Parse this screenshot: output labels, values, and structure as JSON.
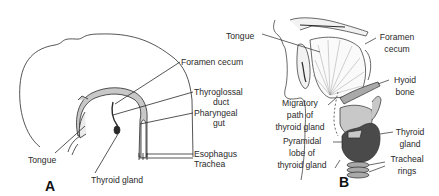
{
  "figure": {
    "panels": [
      {
        "id": "A",
        "letter": "A",
        "labels": {
          "foramen_cecum": "Foramen cecum",
          "thyroglossal_duct_1": "Thyroglossal",
          "thyroglossal_duct_2": "duct",
          "pharyngeal_gut_1": "Pharyngeal",
          "pharyngeal_gut_2": "gut",
          "esophagus": "Esophagus",
          "trachea": "Trachea",
          "tongue": "Tongue",
          "thyroid_gland": "Thyroid gland"
        }
      },
      {
        "id": "B",
        "letter": "B",
        "labels": {
          "tongue": "Tongue",
          "foramen_cecum_1": "Foramen",
          "foramen_cecum_2": "cecum",
          "hyoid_bone_1": "Hyoid",
          "hyoid_bone_2": "bone",
          "migratory_path_1": "Migratory",
          "migratory_path_2": "path of",
          "migratory_path_3": "thyroid gland",
          "thyroid_gland_1": "Thyroid",
          "thyroid_gland_2": "gland",
          "pyramidal_lobe_1": "Pyramidal",
          "pyramidal_lobe_2": "lobe of",
          "pyramidal_lobe_3": "thyroid gland",
          "tracheal_rings_1": "Tracheal",
          "tracheal_rings_2": "rings"
        }
      }
    ],
    "colors": {
      "line": "#2a2a2a",
      "light_gray": "#c8c8c8",
      "mid_gray": "#a9a9a9",
      "dark_gray": "#4a4a4a"
    }
  }
}
